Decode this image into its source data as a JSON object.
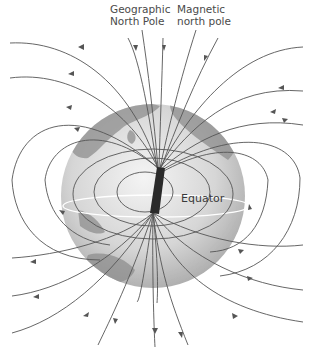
{
  "figure": {
    "labels": {
      "geographic_line1": "Geographic",
      "geographic_line2": "North Pole",
      "magnetic_line1": "Magnetic",
      "magnetic_line2": "north pole",
      "equator": "Equator"
    },
    "elements": {
      "globe": "Earth globe (grayscale)",
      "magnet": "Bar magnet inside Earth",
      "field_lines": "Magnetic field lines with direction arrows"
    },
    "colors": {
      "field_line": "#555555",
      "magnet": "#2a2a2a",
      "globe_light": "#e8e8e8",
      "globe_dark": "#9a9a9a",
      "land": "#8a8a8a",
      "equator": "#ffffff"
    }
  }
}
